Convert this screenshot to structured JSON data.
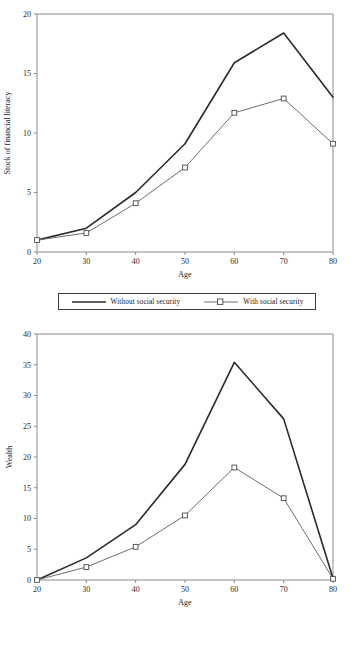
{
  "colors": {
    "without_line": "#2a2a2a",
    "with_line": "#6d6d6d",
    "marker_fill": "#ffffff",
    "marker_stroke": "#6d6d6d",
    "axis": "#8a8a8a",
    "text": "#1a1a1a",
    "background": "#ffffff"
  },
  "legend": {
    "without_label": "Without social security",
    "with_label": "With social security"
  },
  "chart_data": [
    {
      "type": "line",
      "title": "",
      "xlabel": "Age",
      "ylabel": "Stock of financial literacy",
      "x": [
        20,
        30,
        40,
        50,
        60,
        70,
        80
      ],
      "xticklabels": [
        "20",
        "30",
        "40",
        "50",
        "60",
        "70",
        "80"
      ],
      "yticklabels": [
        "0",
        "5",
        "10",
        "15",
        "20"
      ],
      "yticks": [
        0,
        5,
        10,
        15,
        20
      ],
      "xlim": [
        20,
        80
      ],
      "ylim": [
        0,
        20
      ],
      "grid": false,
      "legend_position": "below",
      "series": [
        {
          "name": "Without social security",
          "values": [
            1.0,
            2.0,
            5.0,
            9.1,
            15.9,
            18.4,
            13.0
          ],
          "marker": "none"
        },
        {
          "name": "With social security",
          "values": [
            1.0,
            1.6,
            4.1,
            7.1,
            11.7,
            12.9,
            9.1
          ],
          "marker": "square"
        }
      ]
    },
    {
      "type": "line",
      "title": "",
      "xlabel": "Age",
      "ylabel": "Wealth",
      "x": [
        20,
        30,
        40,
        50,
        60,
        70,
        80
      ],
      "xticklabels": [
        "20",
        "30",
        "40",
        "50",
        "60",
        "70",
        "80"
      ],
      "yticklabels": [
        "0",
        "5",
        "10",
        "15",
        "20",
        "25",
        "30",
        "35",
        "40"
      ],
      "yticks": [
        0,
        5,
        10,
        15,
        20,
        25,
        30,
        35,
        40
      ],
      "xlim": [
        20,
        80
      ],
      "ylim": [
        0,
        40
      ],
      "grid": false,
      "legend_position": "below",
      "series": [
        {
          "name": "Without social security",
          "values": [
            0.0,
            3.6,
            9.0,
            18.8,
            35.4,
            26.2,
            0.3
          ],
          "marker": "none"
        },
        {
          "name": "With social security",
          "values": [
            0.0,
            2.1,
            5.4,
            10.5,
            18.3,
            13.3,
            0.2
          ],
          "marker": "square"
        }
      ]
    }
  ]
}
